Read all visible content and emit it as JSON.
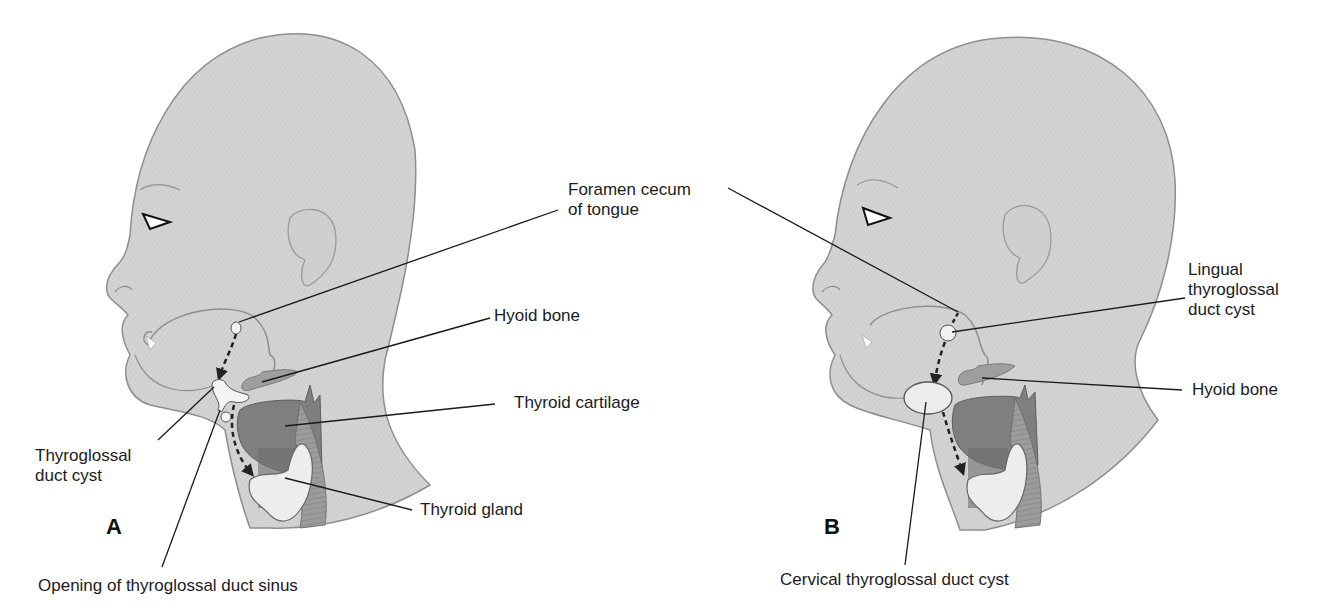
{
  "figure": {
    "panels": [
      {
        "id": "A",
        "letter": "A",
        "labels": {
          "foramen_cecum": [
            "Foramen cecum",
            "of tongue"
          ],
          "hyoid_bone": "Hyoid bone",
          "thyroid_cartilage": "Thyroid cartilage",
          "thyroglossal_duct_cyst": [
            "Thyroglossal",
            "duct cyst"
          ],
          "thyroid_gland": "Thyroid gland",
          "sinus_opening": "Opening of thyroglossal duct sinus"
        }
      },
      {
        "id": "B",
        "letter": "B",
        "labels": {
          "lingual_cyst": [
            "Lingual",
            "thyroglossal",
            "duct cyst"
          ],
          "hyoid_bone": "Hyoid bone",
          "cervical_cyst": "Cervical thyroglossal duct cyst"
        }
      }
    ],
    "colors": {
      "skin": "#d4d4d4",
      "skin_outline": "#8e8e8e",
      "cartilage": "#7f7f7f",
      "hyoid": "#9a9a9a",
      "gland": "#ececec",
      "leader_line": "#1a1a1a",
      "background": "#ffffff"
    }
  }
}
